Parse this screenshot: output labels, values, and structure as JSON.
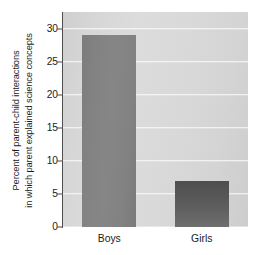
{
  "chart_data": {
    "type": "bar",
    "title": "",
    "subtitle": "",
    "xlabel": "",
    "ylabel_line1": "Percent of parent-child interactions",
    "ylabel_line2": "in which parent explained science concepts",
    "categories": [
      "Boys",
      "Girls"
    ],
    "values": [
      29,
      7
    ],
    "series": [
      {
        "name": "Percent of parent-child interactions in which parent explained science concepts",
        "values": [
          29,
          7
        ]
      }
    ],
    "ylim": [
      0,
      32.5
    ],
    "yticks": [
      0,
      5,
      10,
      15,
      20,
      25,
      30
    ],
    "ytick_labels": [
      "0",
      "5",
      "10",
      "15",
      "20",
      "25",
      "30"
    ],
    "grid": true,
    "grid_axis": "y",
    "legend": false,
    "legend_position": "none",
    "annotations": [],
    "colors": {
      "plot_background": "#d8d8d8",
      "gridline": "#fbfbfb",
      "axis_line": "#4f4f4f",
      "tick_label": "#1a1a1a",
      "bar_boys": "#828282",
      "bar_girls": "#595959",
      "figure_background": "#ffffff"
    }
  }
}
